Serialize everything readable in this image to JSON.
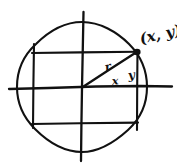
{
  "figure": {
    "kind": "hand-drawn-geometry-diagram",
    "ink_color": "#111111",
    "background_color": "#ffffff"
  },
  "labels": {
    "point": "(x, y)",
    "radius": "r",
    "horizontal_leg": "x",
    "vertical_leg": "y"
  },
  "geometry": {
    "origin": {
      "x": 82,
      "y": 87
    },
    "circle": {
      "cx": 82,
      "cy": 87,
      "r": 65
    },
    "point_on_circle": {
      "x": 137,
      "y": 52
    },
    "x_axis": {
      "x1": 9,
      "y1": 88,
      "x2": 172,
      "y2": 86
    },
    "y_axis": {
      "x1": 83,
      "y1": 12,
      "x2": 81,
      "y2": 161
    },
    "rectangle": {
      "left": 33,
      "top": 52,
      "right": 137,
      "bottom": 123
    },
    "radius_line": {
      "x1": 82,
      "y1": 87,
      "x2": 137,
      "y2": 52
    }
  },
  "label_positions": {
    "point": {
      "x": 141,
      "y": 39
    },
    "radius": {
      "x": 108,
      "y": 68
    },
    "horizontal_leg": {
      "x": 115,
      "y": 82
    },
    "vertical_leg": {
      "x": 131,
      "y": 76
    }
  }
}
